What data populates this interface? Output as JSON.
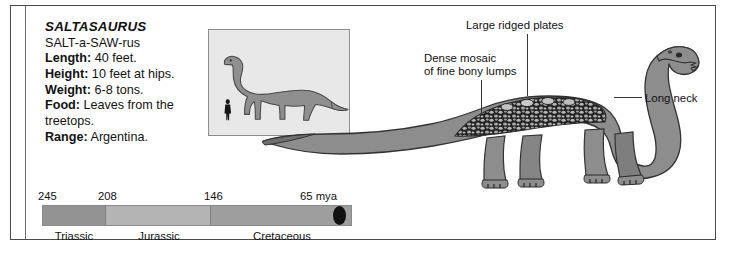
{
  "factbox": {
    "species_name": "SALTASAURUS",
    "pronunciation": "SALT-a-SAW-rus",
    "facts": [
      {
        "label": "Length:",
        "value": " 40 feet."
      },
      {
        "label": "Height:",
        "value": " 10 feet at hips."
      },
      {
        "label": "Weight:",
        "value": " 6-8 tons."
      },
      {
        "label": "Food:",
        "value": " Leaves from the treetops."
      },
      {
        "label": "Range:",
        "value": " Argentina."
      }
    ]
  },
  "annotations": {
    "plates": "Large ridged plates",
    "mosaic": "Dense mosaic\nof fine bony lumps",
    "neck": "Long neck"
  },
  "inset": {
    "caption": "",
    "human_figure": "human-scale-silhouette",
    "dinosaur_figure": "saltasaurus-scale-silhouette"
  },
  "timeline": {
    "unit": "mya",
    "ticks": [
      {
        "value": "245",
        "left_pct": 0
      },
      {
        "value": "208",
        "left_pct": 19.5
      },
      {
        "value": "146",
        "left_pct": 53.5
      },
      {
        "value": "65 mya",
        "left_pct": 100
      }
    ],
    "periods": [
      {
        "name": "Triassic",
        "span_pct": 20.5,
        "color": "#939393"
      },
      {
        "name": "Jurassic",
        "span_pct": 34.0,
        "color": "#b4b4b4"
      },
      {
        "name": "Cretaceous",
        "span_pct": 45.5,
        "color": "#9e9e9e"
      }
    ],
    "extinction_marker": "extinction-oval-marker"
  },
  "colors": {
    "body_fill": "#8a8a8a",
    "body_dark": "#6e6e6e",
    "armor_dark": "#242424",
    "armor_lump": "#b9b9b9",
    "inset_bg": "#e8e8e8",
    "frame": "#4a4a4a",
    "text": "#111111"
  }
}
